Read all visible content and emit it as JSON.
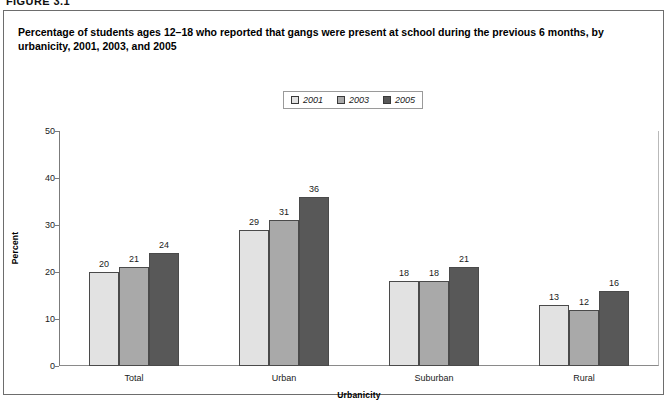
{
  "figure": {
    "number_label": "FIGURE 3.1",
    "caption": "Percentage of students ages 12–18 who reported that gangs were present at school during the previous 6 months, by urbanicity, 2001, 2003, and 2005"
  },
  "colors": {
    "series_2001": "#e2e2e2",
    "series_2003": "#a9a9a9",
    "series_2005": "#585858",
    "bar_outline": "#4a4a4a",
    "frame": "#7b7b7b"
  },
  "chart_data": {
    "type": "bar",
    "title": "Percentage of students ages 12–18 who reported that gangs were present at school during the previous 6 months, by urbanicity, 2001, 2003, and 2005",
    "xlabel": "Urbanicity",
    "ylabel": "Percent",
    "ylim": [
      0,
      50
    ],
    "yticks": [
      0,
      10,
      20,
      30,
      40,
      50
    ],
    "ytick_labels": [
      "0",
      "10",
      "20",
      "30",
      "40",
      "50"
    ],
    "grid": false,
    "legend_position": "top-center",
    "categories": [
      "Total",
      "Urban",
      "Suburban",
      "Rural"
    ],
    "series": [
      {
        "name": "2001",
        "color": "#e2e2e2",
        "values": [
          20,
          29,
          18,
          13
        ]
      },
      {
        "name": "2003",
        "color": "#a9a9a9",
        "values": [
          21,
          31,
          18,
          12
        ]
      },
      {
        "name": "2005",
        "color": "#585858",
        "values": [
          24,
          36,
          21,
          16
        ]
      }
    ]
  }
}
